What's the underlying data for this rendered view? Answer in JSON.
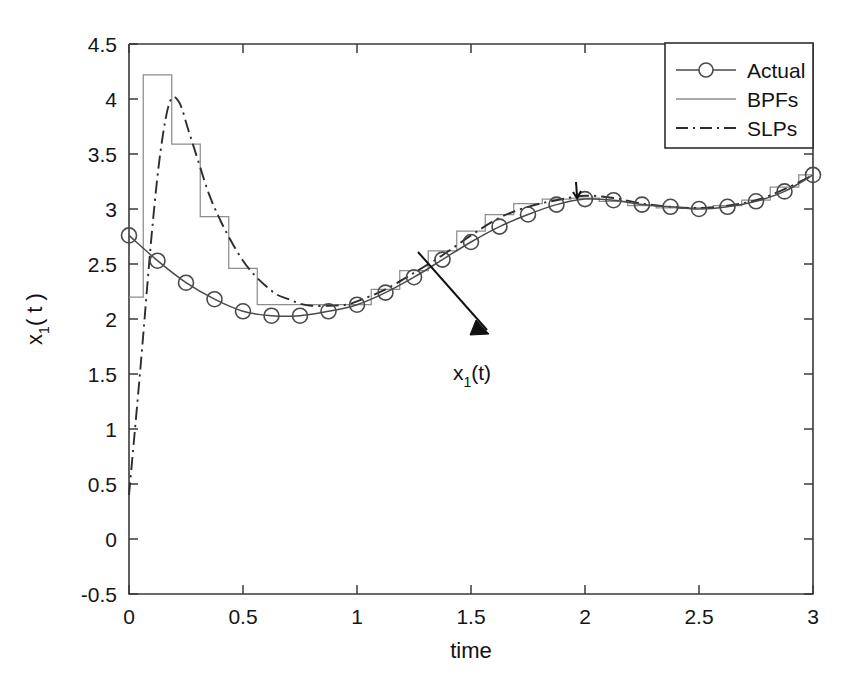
{
  "chart_data": {
    "type": "line",
    "title": "",
    "xlabel": "time",
    "ylabel": "x_1( t )",
    "xlim": [
      0,
      3
    ],
    "ylim": [
      -0.5,
      4.5
    ],
    "xticks": [
      "0",
      "0.5",
      "1",
      "1.5",
      "2",
      "2.5",
      "3"
    ],
    "xtick_values": [
      0,
      0.5,
      1,
      1.5,
      2,
      2.5,
      3
    ],
    "yticks": [
      "-0.5",
      "0",
      "0.5",
      "1",
      "1.5",
      "2",
      "2.5",
      "3",
      "3.5",
      "4",
      "4.5"
    ],
    "ytick_values": [
      -0.5,
      0,
      0.5,
      1,
      1.5,
      2,
      2.5,
      3,
      3.5,
      4,
      4.5
    ],
    "grid": false,
    "legend_position": "top-right",
    "legend": [
      "Actual",
      "BPFs",
      "SLPs"
    ],
    "annotations": [
      {
        "text": "x_1(t)",
        "x": 1.62,
        "y": 1.62,
        "arrow_to_x": 1.27,
        "arrow_to_y": 2.7
      }
    ],
    "series": [
      {
        "name": "Actual",
        "style": "solid-with-circle-markers",
        "color": "#4a4a4a",
        "x": [
          0,
          0.125,
          0.25,
          0.375,
          0.5,
          0.625,
          0.75,
          0.875,
          1.0,
          1.125,
          1.25,
          1.375,
          1.5,
          1.625,
          1.75,
          1.875,
          2.0,
          2.125,
          2.25,
          2.375,
          2.5,
          2.625,
          2.75,
          2.875,
          3.0
        ],
        "values": [
          2.76,
          2.53,
          2.33,
          2.18,
          2.07,
          2.03,
          2.03,
          2.07,
          2.13,
          2.24,
          2.38,
          2.54,
          2.7,
          2.84,
          2.95,
          3.04,
          3.09,
          3.08,
          3.04,
          3.02,
          3.0,
          3.02,
          3.07,
          3.16,
          3.31
        ]
      },
      {
        "name": "BPFs",
        "style": "step",
        "color": "#8d8d8d",
        "x": [
          0,
          0.125,
          0.25,
          0.375,
          0.5,
          0.625,
          0.75,
          0.875,
          1.0,
          1.125,
          1.25,
          1.375,
          1.5,
          1.625,
          1.75,
          1.875,
          2.0,
          2.125,
          2.25,
          2.375,
          2.5,
          2.625,
          2.75,
          2.875,
          3.0
        ],
        "values": [
          2.2,
          4.22,
          3.59,
          2.93,
          2.46,
          2.13,
          2.13,
          2.13,
          2.13,
          2.27,
          2.44,
          2.62,
          2.8,
          2.95,
          3.05,
          3.09,
          3.1,
          3.07,
          3.03,
          3.01,
          3.01,
          3.03,
          3.08,
          3.2,
          3.31
        ]
      },
      {
        "name": "SLPs",
        "style": "dash-dot",
        "color": "#2e2e2e",
        "x": [
          0,
          0.05,
          0.1,
          0.14,
          0.18,
          0.22,
          0.26,
          0.3,
          0.35,
          0.4,
          0.45,
          0.5,
          0.55,
          0.6,
          0.65,
          0.7,
          0.75,
          0.8,
          0.875,
          0.95,
          1.0,
          1.125,
          1.25,
          1.375,
          1.5,
          1.625,
          1.75,
          1.875,
          2.0,
          2.125,
          2.25,
          2.375,
          2.5,
          2.625,
          2.75,
          2.875,
          3.0
        ],
        "values": [
          0.4,
          1.55,
          2.78,
          3.55,
          3.98,
          3.97,
          3.72,
          3.46,
          3.14,
          2.9,
          2.7,
          2.53,
          2.4,
          2.3,
          2.22,
          2.18,
          2.14,
          2.12,
          2.12,
          2.13,
          2.16,
          2.27,
          2.42,
          2.58,
          2.76,
          2.92,
          3.02,
          3.08,
          3.12,
          3.1,
          3.05,
          3.02,
          3.01,
          3.03,
          3.08,
          3.18,
          3.31
        ]
      }
    ]
  },
  "axes": {
    "x_title": "time",
    "y_title_main": "x",
    "y_title_sub": "1",
    "y_title_rest": "( t )"
  },
  "legend": {
    "items": [
      {
        "label": "Actual",
        "marker": "circle",
        "line": "solid"
      },
      {
        "label": "BPFs",
        "marker": "none",
        "line": "solid"
      },
      {
        "label": "SLPs",
        "marker": "none",
        "line": "dash-dot"
      }
    ]
  },
  "annotation": {
    "label_main": "x",
    "label_sub": "1",
    "label_rest": "(t)"
  },
  "colors": {
    "actual": "#4a4a4a",
    "bpfs": "#8d8d8d",
    "slps": "#2e2e2e",
    "axis": "#3a3a3a",
    "background": "#ffffff"
  }
}
